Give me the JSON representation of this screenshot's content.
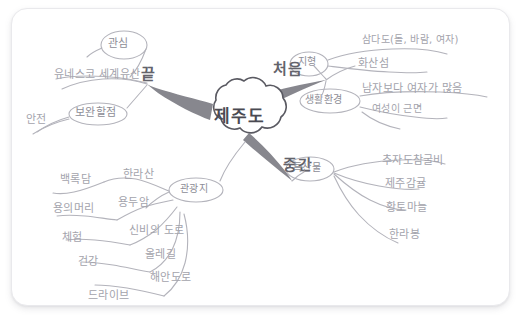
{
  "page": {
    "background": "#ffffff",
    "card_color": "#ffffff",
    "ink_color": "#9b9ba3",
    "branch_color": "#7d7d85"
  },
  "mindmap": {
    "center": {
      "label": "제주도",
      "shape": "cloud"
    },
    "stages": [
      {
        "key": "end",
        "label": "끝"
      },
      {
        "key": "start",
        "label": "처음"
      },
      {
        "key": "middle",
        "label": "중간"
      }
    ],
    "branches": [
      {
        "key": "end",
        "stage_label": "끝",
        "nodes": [
          {
            "label": "관심",
            "shape": "oval",
            "children": [
              {
                "label": "유네스코 세계유산"
              }
            ]
          },
          {
            "label": "보완할점",
            "shape": "oval",
            "children": [
              {
                "label": "안전"
              }
            ]
          }
        ]
      },
      {
        "key": "start",
        "stage_label": "처음",
        "nodes": [
          {
            "label": "지형",
            "shape": "oval",
            "children": [
              {
                "label": "삼다도(돌, 바람, 여자)"
              },
              {
                "label": "화산섬"
              }
            ]
          },
          {
            "label": "생활환경",
            "shape": "oval",
            "children": [
              {
                "label": "남자보다 여자가 많음"
              },
              {
                "label": "여성이 근면"
              }
            ]
          }
        ]
      },
      {
        "key": "middle",
        "stage_label": "중간",
        "nodes": [
          {
            "label": "특산물",
            "shape": "oval",
            "children": [
              {
                "label": "추자도참굴비"
              },
              {
                "label": "제주감귤"
              },
              {
                "label": "황토마늘"
              },
              {
                "label": "한라봉"
              }
            ]
          },
          {
            "label": "관광지",
            "shape": "oval",
            "children": [
              {
                "label": "한라산"
              },
              {
                "label": "백록담"
              },
              {
                "label": "용두암"
              },
              {
                "label": "용의머리"
              },
              {
                "label": "신비의 도로"
              },
              {
                "label": "체험"
              },
              {
                "label": "올레길"
              },
              {
                "label": "건강"
              },
              {
                "label": "해안도로"
              },
              {
                "label": "드라이브"
              }
            ]
          }
        ]
      }
    ]
  }
}
